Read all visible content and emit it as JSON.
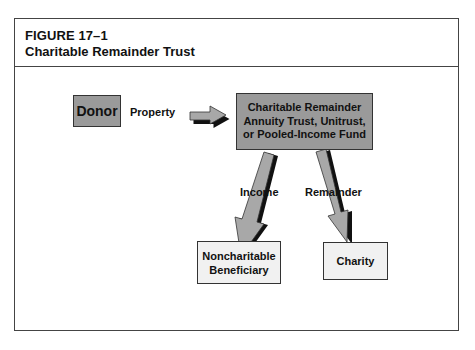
{
  "figure": {
    "number": "FIGURE 17–1",
    "title": "Charitable Remainder Trust"
  },
  "nodes": {
    "donor": {
      "label": "Donor"
    },
    "trust": {
      "lines": [
        "Charitable Remainder",
        "Annuity Trust, Unitrust,",
        "or Pooled-Income Fund"
      ]
    },
    "beneficiary": {
      "lines": [
        "Noncharitable",
        "Beneficiary"
      ]
    },
    "charity": {
      "label": "Charity"
    }
  },
  "edges": {
    "property": {
      "label": "Property",
      "from": "donor",
      "to": "trust"
    },
    "income": {
      "label": "Income",
      "from": "trust",
      "to": "beneficiary"
    },
    "remainder": {
      "label": "Remainder",
      "from": "trust",
      "to": "charity"
    }
  },
  "colors": {
    "dark_box": "#9a9a9a",
    "light_box": "#f1f1f1",
    "arrow_fill": "#a8a8a8",
    "arrow_shadow": "#111111",
    "border": "#444444"
  }
}
